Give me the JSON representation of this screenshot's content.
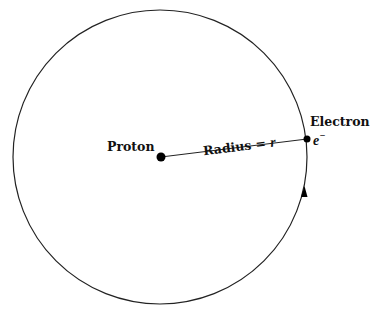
{
  "diagram": {
    "type": "bohr-hydrogen-atom",
    "orbit": {
      "cx": 160,
      "cy": 157,
      "r": 147,
      "stroke": "#222222"
    },
    "proton": {
      "label": "Proton",
      "x": 161,
      "y": 157
    },
    "electron": {
      "label": "Electron",
      "symbol": "e",
      "superscript": "−",
      "x": 307,
      "y": 139
    },
    "radius_label": {
      "text": "Radius = ",
      "variable": "r"
    },
    "direction_arrow": {
      "x": 304,
      "y": 193,
      "direction": "counterclockwise-up"
    }
  }
}
